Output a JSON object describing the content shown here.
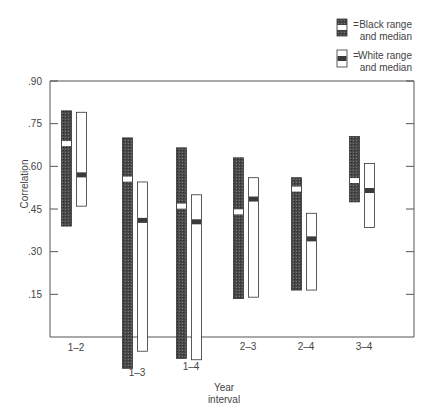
{
  "chart_data": {
    "type": "bar",
    "subtype": "range-bar-with-median",
    "title": "",
    "xlabel": "Year interval",
    "xlabel_lines": [
      "Year",
      "interval"
    ],
    "ylabel": "Correlation",
    "ylim": [
      0,
      0.9
    ],
    "yticks": [
      0.15,
      0.3,
      0.45,
      0.6,
      0.75,
      0.9
    ],
    "ytick_labels": [
      ".15",
      ".30",
      ".45",
      ".60",
      ".75",
      ".90"
    ],
    "categories": [
      "1–2",
      "1–3",
      "1–4",
      "2–3",
      "2–4",
      "3–4"
    ],
    "grid": false,
    "legend_position": "top-right",
    "series": [
      {
        "name": "Black range and median",
        "legend_lines": [
          "Black range",
          "and median"
        ],
        "style": "dark-hatched",
        "color": "#3a3a3a",
        "median_color": "#ffffff",
        "max": [
          0.795,
          0.7,
          0.665,
          0.63,
          0.56,
          0.705
        ],
        "min": [
          0.39,
          -0.11,
          -0.075,
          0.135,
          0.165,
          0.475
        ],
        "median": [
          0.68,
          0.555,
          0.46,
          0.44,
          0.52,
          0.55
        ]
      },
      {
        "name": "White range and median",
        "legend_lines": [
          "White range",
          "and median"
        ],
        "style": "white",
        "color": "#ffffff",
        "median_color": "#3a3a3a",
        "max": [
          0.79,
          0.545,
          0.5,
          0.56,
          0.435,
          0.61
        ],
        "min": [
          0.46,
          -0.05,
          -0.08,
          0.14,
          0.165,
          0.385
        ],
        "median": [
          0.57,
          0.41,
          0.405,
          0.485,
          0.345,
          0.515
        ]
      }
    ],
    "legend_symbol": "="
  }
}
